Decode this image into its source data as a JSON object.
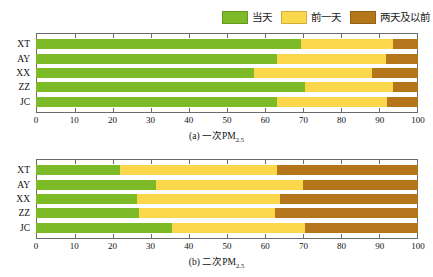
{
  "legend": {
    "items": [
      {
        "label": "当天",
        "color": "#7DBA28",
        "icon": "legend-swatch-same-day"
      },
      {
        "label": "前一天",
        "color": "#FAD74B",
        "icon": "legend-swatch-previous-day"
      },
      {
        "label": "两天及以前",
        "color": "#B5761B",
        "icon": "legend-swatch-two-days-before"
      }
    ]
  },
  "chart_data": [
    {
      "type": "bar",
      "orientation": "horizontal",
      "stacked": true,
      "title": "(a) 一次PM2.5",
      "title_main": "(a) 一次PM",
      "title_sub": "2.5",
      "categories": [
        "XT",
        "AY",
        "XX",
        "ZZ",
        "JC"
      ],
      "series": [
        {
          "name": "当天",
          "color": "#7DBA28",
          "values": [
            69.5,
            63.0,
            57.0,
            70.5,
            63.0
          ]
        },
        {
          "name": "前一天",
          "color": "#FAD74B",
          "values": [
            24.0,
            28.5,
            31.0,
            23.0,
            29.0
          ]
        },
        {
          "name": "两天及以前",
          "color": "#B5761B",
          "values": [
            6.5,
            8.5,
            12.0,
            6.5,
            8.0
          ]
        }
      ],
      "xlabel": "",
      "ylabel": "",
      "xlim": [
        0,
        100
      ],
      "xticks": [
        0,
        10,
        20,
        30,
        40,
        50,
        60,
        70,
        80,
        90,
        100
      ],
      "grid": false,
      "legend_position": "top-right"
    },
    {
      "type": "bar",
      "orientation": "horizontal",
      "stacked": true,
      "title": "(b) 二次PM2.5",
      "title_main": "(b) 二次PM",
      "title_sub": "2.5",
      "categories": [
        "XT",
        "AY",
        "XX",
        "ZZ",
        "JC"
      ],
      "series": [
        {
          "name": "当天",
          "color": "#7DBA28",
          "values": [
            22.0,
            31.5,
            26.5,
            27.0,
            35.5
          ]
        },
        {
          "name": "前一天",
          "color": "#FAD74B",
          "values": [
            41.0,
            38.5,
            37.5,
            35.5,
            35.0
          ]
        },
        {
          "name": "两天及以前",
          "color": "#B5761B",
          "values": [
            37.0,
            30.0,
            36.0,
            37.5,
            29.5
          ]
        }
      ],
      "xlabel": "",
      "ylabel": "",
      "xlim": [
        0,
        100
      ],
      "xticks": [
        0,
        10,
        20,
        30,
        40,
        50,
        60,
        70,
        80,
        90,
        100
      ],
      "grid": false,
      "legend_position": "top-right"
    }
  ]
}
